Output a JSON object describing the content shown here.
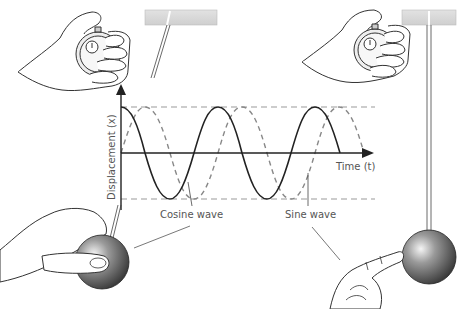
{
  "diagram": {
    "axis": {
      "y_label": "Displacement (x)",
      "x_label": "Time (t)"
    },
    "curves": [
      {
        "name": "cosine",
        "label": "Cosine wave",
        "style": "solid",
        "color": "#222222"
      },
      {
        "name": "sine",
        "label": "Sine wave",
        "style": "dashed",
        "color": "#888888"
      }
    ],
    "amplitude_guides": {
      "style": "dashed",
      "color": "#999999"
    },
    "scenes": {
      "left": {
        "description": "Hand starting stopwatch; pendulum bob held at maximum displacement",
        "start": "cosine"
      },
      "right": {
        "description": "Hand starting stopwatch; pendulum bob at rest position being pushed",
        "start": "sine"
      }
    },
    "colors": {
      "ceiling": "#d8d8d8",
      "bob_dark": "#3a3a3a",
      "bob_light": "#f0f0f0",
      "skin_fill": "#ffffff",
      "outline": "#333333"
    }
  }
}
